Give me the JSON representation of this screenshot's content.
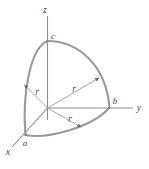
{
  "figure": {
    "axes": [
      {
        "name": "z-axis",
        "label": "z"
      },
      {
        "name": "y-axis",
        "label": "y"
      },
      {
        "name": "x-axis",
        "label": "x"
      }
    ],
    "points": [
      {
        "name": "point-c",
        "label": "c"
      },
      {
        "name": "point-b",
        "label": "b"
      },
      {
        "name": "point-a",
        "label": "a"
      }
    ],
    "radii": [
      {
        "name": "radius-left",
        "label": "r"
      },
      {
        "name": "radius-upper-right",
        "label": "r"
      },
      {
        "name": "radius-lower-right",
        "label": "r"
      }
    ],
    "caption": "",
    "colors": {
      "arc": "#9a9a9a",
      "axis": "#8c8c8c",
      "radius_line": "#a5a5a5",
      "label": "#4a4a4a",
      "background": "#ffffff"
    }
  }
}
